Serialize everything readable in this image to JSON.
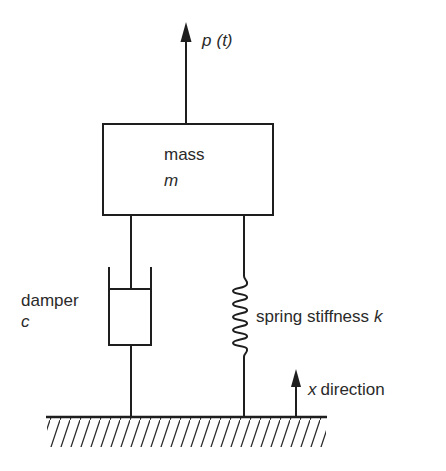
{
  "diagram": {
    "force": {
      "symbol": "p",
      "argument": "(t)"
    },
    "mass": {
      "label": "mass",
      "symbol": "m"
    },
    "damper": {
      "label": "damper",
      "symbol": "c"
    },
    "spring": {
      "label": "spring stiffness",
      "symbol": "k"
    },
    "direction": {
      "symbol": "x",
      "label": "direction"
    },
    "colors": {
      "line": "#1e1e1e",
      "text": "#2a2a2a",
      "background": "#ffffff"
    }
  }
}
